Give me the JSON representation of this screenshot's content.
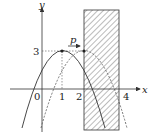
{
  "diagram": {
    "axes": {
      "x_label": "x",
      "y_label": "y",
      "origin_label": "0",
      "x_ticks": [
        "1",
        "2",
        "4"
      ],
      "y_ticks": [
        "3"
      ]
    },
    "vertex_label": "3",
    "shift_label": "p",
    "shaded_region": {
      "from": "2",
      "to": "4"
    },
    "colors": {
      "stroke": "#333333",
      "hatch": "#555555",
      "background": "#ffffff"
    }
  }
}
